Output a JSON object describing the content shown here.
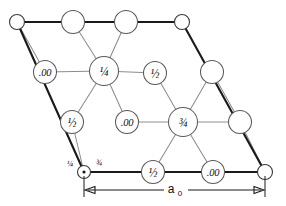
{
  "figure": {
    "cell_shape": "rhombus",
    "dimension_label": "a",
    "dimension_subscript": "0",
    "colors": {
      "cell_edge": "#1a1a1a",
      "bond_line": "#8d8d8d",
      "atom_fill": "#ffffff",
      "atom_stroke": "#5a5a5a",
      "background": "#ffffff",
      "text": "#111111"
    },
    "corners": {
      "top_left": {
        "x": 17,
        "y": 22
      },
      "top_right": {
        "x": 182,
        "y": 22
      },
      "bottom_left": {
        "x": 84,
        "y": 172
      },
      "bottom_right": {
        "x": 265,
        "y": 172
      }
    }
  },
  "atoms": [
    {
      "id": "corner-tl",
      "label": "",
      "x": 17,
      "y": 22,
      "r": 7.5,
      "size": "small",
      "dot": false
    },
    {
      "id": "top-a",
      "label": "",
      "x": 73,
      "y": 22,
      "r": 11.5,
      "size": "large",
      "dot": false
    },
    {
      "id": "top-b",
      "label": "",
      "x": 126,
      "y": 22,
      "r": 11.5,
      "size": "large",
      "dot": false
    },
    {
      "id": "corner-tr",
      "label": "",
      "x": 182,
      "y": 22,
      "r": 7.5,
      "size": "small",
      "dot": false
    },
    {
      "id": "left-00",
      "label": ".00",
      "x": 45,
      "y": 72,
      "r": 11.5,
      "size": "large",
      "dot": false
    },
    {
      "id": "quarter",
      "label": "¼",
      "x": 104,
      "y": 71,
      "r": 14.5,
      "size": "large",
      "dot": false
    },
    {
      "id": "half-upper",
      "label": "½",
      "x": 155,
      "y": 73,
      "r": 11.5,
      "size": "large",
      "dot": false
    },
    {
      "id": "right-mid",
      "label": "",
      "x": 212,
      "y": 72,
      "r": 11.5,
      "size": "large",
      "dot": false
    },
    {
      "id": "half-left",
      "label": "½",
      "x": 72,
      "y": 122,
      "r": 11.5,
      "size": "large",
      "dot": false
    },
    {
      "id": "center-00",
      "label": ".00",
      "x": 127,
      "y": 122,
      "r": 11.5,
      "size": "large",
      "dot": false
    },
    {
      "id": "three-quart",
      "label": "¾",
      "x": 183,
      "y": 122,
      "r": 14.5,
      "size": "large",
      "dot": false
    },
    {
      "id": "right-low",
      "label": "",
      "x": 240,
      "y": 122,
      "r": 11.5,
      "size": "large",
      "dot": false
    },
    {
      "id": "corner-bl",
      "label": "",
      "x": 84,
      "y": 172,
      "r": 6.5,
      "size": "small",
      "dot": true
    },
    {
      "id": "half-bottom",
      "label": "½",
      "x": 153,
      "y": 172,
      "r": 11.5,
      "size": "large",
      "dot": false
    },
    {
      "id": "bottom-00",
      "label": ".00",
      "x": 213,
      "y": 172,
      "r": 11.5,
      "size": "large",
      "dot": false
    },
    {
      "id": "corner-br",
      "label": "",
      "x": 265,
      "y": 172,
      "r": 7.5,
      "size": "small",
      "dot": false
    }
  ],
  "corner_annotations": [
    {
      "id": "bl-left-frac",
      "label": "¼",
      "x": 70,
      "y": 163
    },
    {
      "id": "bl-right-frac",
      "label": "¾",
      "x": 99,
      "y": 162
    }
  ],
  "dimension": {
    "y": 190,
    "x_start": 84,
    "x_end": 265,
    "label_x": 175,
    "label_y": 189,
    "tick_top": 174,
    "tick_bottom": 196
  }
}
